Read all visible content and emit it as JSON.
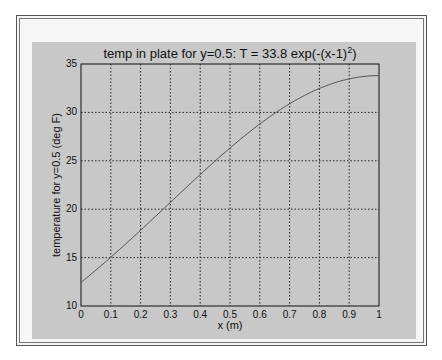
{
  "figure": {
    "background_color": "#c8c8c8",
    "plot_background": "#ffffff"
  },
  "chart_data": {
    "type": "line",
    "title_main": "temp in plate for y=0.5: T = 33.8 exp(-(x-1)",
    "title_superscript": "2",
    "title_end": ")",
    "xlabel": "x (m)",
    "ylabel": "temperature for y=0.5 (deg F)",
    "xlim": [
      0,
      1
    ],
    "ylim": [
      10,
      35
    ],
    "grid": true,
    "grid_style": "dotted",
    "x_ticks": [
      "0",
      "0.1",
      "0.2",
      "0.3",
      "0.4",
      "0.5",
      "0.6",
      "0.7",
      "0.8",
      "0.9",
      "1"
    ],
    "y_ticks": [
      "10",
      "15",
      "20",
      "25",
      "30",
      "35"
    ],
    "series": [
      {
        "name": "T(x)",
        "color": "#555555",
        "x": [
          0,
          0.05,
          0.1,
          0.15,
          0.2,
          0.25,
          0.3,
          0.35,
          0.4,
          0.45,
          0.5,
          0.55,
          0.6,
          0.65,
          0.7,
          0.75,
          0.8,
          0.85,
          0.9,
          0.95,
          1.0
        ],
        "y": [
          12.43,
          13.74,
          15.11,
          16.53,
          17.98,
          19.28,
          20.77,
          22.15,
          23.51,
          24.81,
          26.32,
          27.53,
          28.81,
          29.87,
          30.9,
          31.75,
          32.46,
          33.04,
          33.46,
          33.72,
          33.8
        ]
      }
    ]
  },
  "footer": {
    "partial_text": ""
  }
}
